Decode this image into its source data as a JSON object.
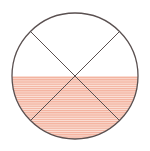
{
  "diagram": {
    "type": "fraction-circle",
    "total_parts": 4,
    "shaded_region": "lower-half",
    "shaded_fraction": "1/2",
    "colors": {
      "outline": "#5a5050",
      "divider": "#5a5050",
      "shade_stripe": "#f3b09c",
      "shade_gap": "#fbe3da",
      "background": "#ffffff"
    },
    "geometry": {
      "cx": 75,
      "cy": 76,
      "r": 63,
      "shade_top_y": 76
    }
  }
}
